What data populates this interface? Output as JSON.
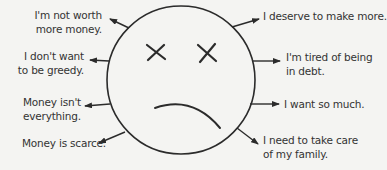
{
  "diagram": {
    "type": "sad-face-with-money-beliefs",
    "center_icon": "sad-face-icon",
    "colors": {
      "background": "#f4f4f2",
      "stroke": "#2b2b2b",
      "text": "#333333"
    },
    "left_labels": [
      {
        "line1": "I'm not worth",
        "line2": "more money."
      },
      {
        "line1": "I don't want",
        "line2": "to be greedy."
      },
      {
        "line1": "Money isn't",
        "line2": "everything."
      },
      {
        "line1": "Money is scarce.",
        "line2": ""
      }
    ],
    "right_labels": [
      {
        "line1": "I deserve to make more.",
        "line2": ""
      },
      {
        "line1": "I'm tired of being",
        "line2": "in debt."
      },
      {
        "line1": "I want so much.",
        "line2": ""
      },
      {
        "line1": "I need to take care",
        "line2": "of my family."
      }
    ]
  }
}
